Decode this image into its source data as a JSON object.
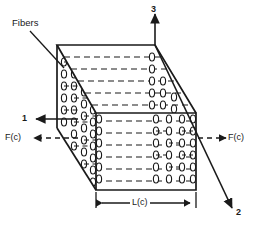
{
  "figure": {
    "type": "engineering-diagram",
    "background_color": "#ffffff",
    "line_color": "#1a1a1a"
  },
  "labels": {
    "fibers": "Fibers",
    "axis_1": "1",
    "axis_2": "2",
    "axis_3": "3",
    "force_left": "F(c)",
    "force_right": "F(c)",
    "length": "L(c)"
  },
  "geometry": {
    "front_face": {
      "x1": 96,
      "y1": 113,
      "x2": 196,
      "y2": 190
    },
    "back_face": {
      "x1": 57,
      "y1": 45,
      "x2": 155,
      "y2": 128
    },
    "depth_vector": {
      "dx": 39,
      "dy": 68
    }
  },
  "annotations": {
    "dimension_line_y": 203,
    "dimension_x_start": 96,
    "dimension_x_end": 196,
    "fiber_rows_front": 6,
    "fiber_columns_side": 4
  }
}
